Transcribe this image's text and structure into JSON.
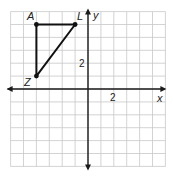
{
  "figure": {
    "type": "coordinate-plane",
    "grid": {
      "x_min": -6,
      "x_max": 6,
      "y_min": -6,
      "y_max": 6,
      "origin_px": [
        88,
        89
      ],
      "cell_px": 12.9,
      "grid_color": "#c8c8c8",
      "axis_color": "#1a1a1a"
    },
    "axes": {
      "x_label": "x",
      "y_label": "y",
      "x_tick_label": "2",
      "y_tick_label": "2"
    },
    "triangle": {
      "name": "triangle ALZ",
      "stroke_color": "#111111",
      "vertices": [
        {
          "name": "A",
          "x": -4,
          "y": 5
        },
        {
          "name": "L",
          "x": -1,
          "y": 5
        },
        {
          "name": "Z",
          "x": -4,
          "y": 1
        }
      ]
    }
  }
}
